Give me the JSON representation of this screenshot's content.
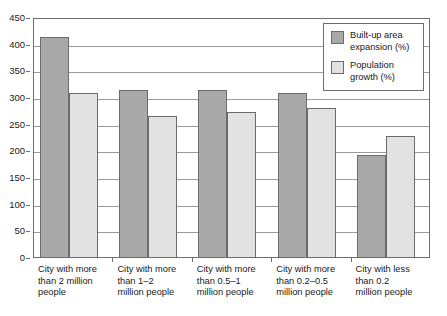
{
  "chart_data": {
    "type": "bar",
    "title": "",
    "subtitle": "",
    "xlabel": "",
    "ylabel": "",
    "ylim": [
      0,
      450
    ],
    "ytick_step": 50,
    "yticks": [
      0,
      50,
      100,
      150,
      200,
      250,
      300,
      350,
      400,
      450
    ],
    "ytick_labels": [
      "0",
      "50",
      "100",
      "150",
      "200",
      "250",
      "300",
      "350",
      "400",
      "450"
    ],
    "grid": true,
    "legend_position": "top-right",
    "categories": [
      "City with more than 2 million people",
      "City with more than 1–2 million people",
      "City with more than 0.5–1 million people",
      "City with more than 0.2–0.5 million people",
      "City with less than 0.2 million people"
    ],
    "category_lines": [
      [
        "City with more",
        "than 2 million",
        "people"
      ],
      [
        "City with more",
        "than 1–2",
        "million people"
      ],
      [
        "City with more",
        "than 0.5–1",
        "million people"
      ],
      [
        "City with more",
        "than 0.2–0.5",
        "million people"
      ],
      [
        "City with less",
        "than 0.2",
        "million people"
      ]
    ],
    "series": [
      {
        "name": "Built-up area expansion (%)",
        "color": "#a9a9a9",
        "values": [
          415,
          315,
          315,
          310,
          193
        ]
      },
      {
        "name": "Population growth (%)",
        "color": "#e2e2e2",
        "values": [
          309,
          267,
          273,
          281,
          229
        ]
      }
    ]
  },
  "legend": {
    "entries": [
      {
        "label_lines": [
          "Built-up area",
          "expansion (%)"
        ],
        "color": "#a9a9a9"
      },
      {
        "label_lines": [
          "Population",
          "growth (%)"
        ],
        "color": "#e2e2e2"
      }
    ]
  },
  "colors": {
    "series_0": "#a9a9a9",
    "series_1": "#e2e2e2",
    "bar_border": "#6b6b6b",
    "frame": "#6e6e6e",
    "grid": "#9a9a9a",
    "text": "#1a1a1a",
    "background": "#ffffff"
  }
}
